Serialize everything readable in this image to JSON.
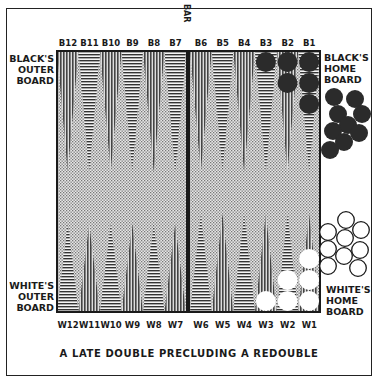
{
  "caption": "A LATE DOUBLE PRECLUDING A REDOUBLE",
  "bar_label": "BAR",
  "labels": {
    "black_outer": [
      "BLACK'S",
      "OUTER",
      "BOARD"
    ],
    "black_home": [
      "BLACK'S",
      "HOME",
      "BOARD"
    ],
    "white_outer": [
      "WHITE'S",
      "OUTER",
      "BOARD"
    ],
    "white_home": [
      "WHITE'S",
      "HOME",
      "BOARD"
    ]
  },
  "top_points": [
    "B12",
    "B11",
    "B10",
    "B9",
    "B8",
    "B7",
    "B6",
    "B5",
    "B4",
    "B3",
    "B2",
    "B1"
  ],
  "bottom_points": [
    "W12",
    "W11",
    "W10",
    "W9",
    "W8",
    "W7",
    "W6",
    "W5",
    "W4",
    "W3",
    "W2",
    "W1"
  ],
  "position": {
    "black_on_board": {
      "B3": 1,
      "B2": 2,
      "B1": 3
    },
    "white_on_board": {
      "W3": 1,
      "W2": 2,
      "W1": 3
    },
    "black_borne_off": 9,
    "white_borne_off": 9
  },
  "colors": {
    "ink": "#1a1a1a",
    "black_checker": "#2b2b2b",
    "white_checker": "#ffffff",
    "board_bg": "#c8c8c8"
  }
}
